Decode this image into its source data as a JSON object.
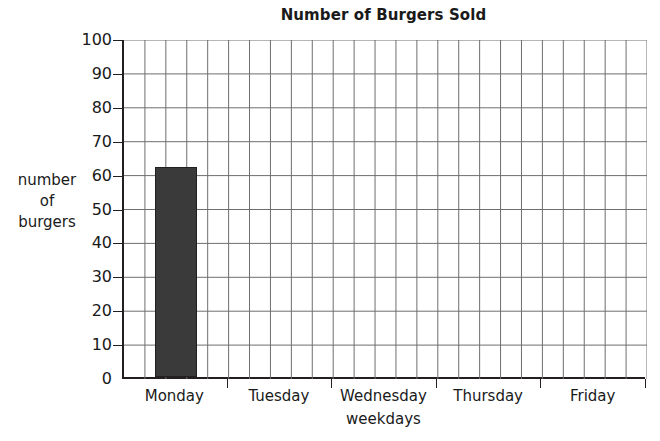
{
  "chart_data": {
    "type": "bar",
    "title": "Number of Burgers Sold",
    "xlabel": "weekdays",
    "ylabel": "number of burgers",
    "ylabel_lines": [
      "number",
      "of",
      "burgers"
    ],
    "categories": [
      "Monday",
      "Tuesday",
      "Wednesday",
      "Thursday",
      "Friday"
    ],
    "values": [
      62,
      0,
      0,
      0,
      0
    ],
    "ylim": [
      0,
      100
    ],
    "ytick_labels": [
      "0",
      "10",
      "20",
      "30",
      "40",
      "50",
      "60",
      "70",
      "80",
      "90",
      "100"
    ],
    "ytick_values": [
      0,
      10,
      20,
      30,
      40,
      50,
      60,
      70,
      80,
      90,
      100
    ],
    "grid": true,
    "grid_minor_vertical_per_category": 5,
    "legend": "none",
    "bar_color": "#3a3a3a",
    "bar_edge_color": "#231f20",
    "grid_color": "#6e6e6e",
    "axis_color": "#231f20",
    "background_color": "#ffffff"
  }
}
